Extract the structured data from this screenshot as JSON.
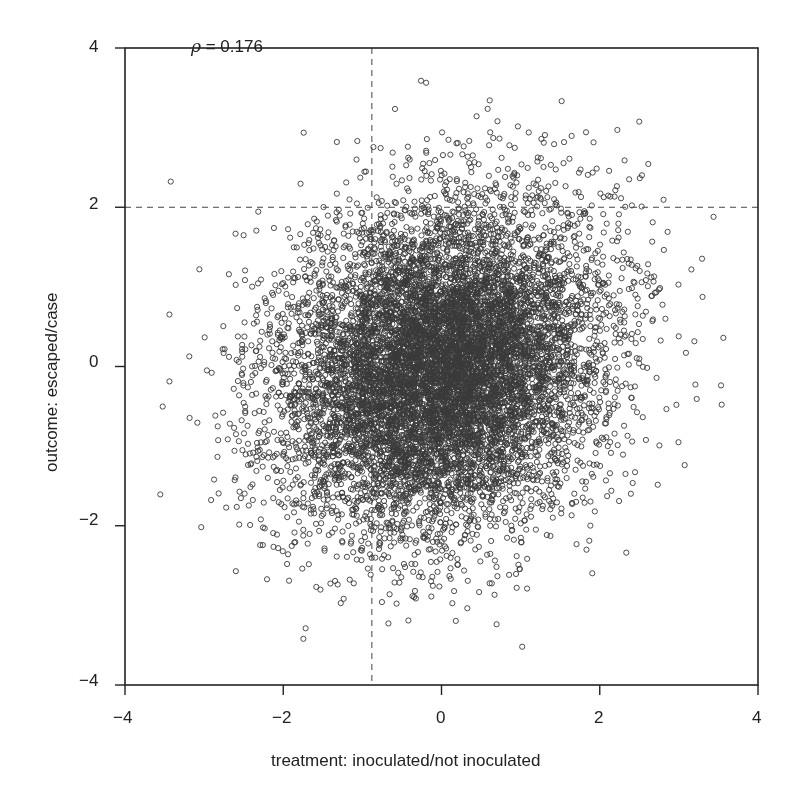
{
  "chart_data": {
    "type": "scatter",
    "title": "",
    "xlabel": "treatment: inoculated/not inoculated",
    "ylabel": "outcome: escaped/case",
    "xlim": [
      -4,
      4
    ],
    "ylim": [
      -4,
      4
    ],
    "xticks": [
      -4,
      -2,
      0,
      2,
      4
    ],
    "yticks": [
      -4,
      -2,
      0,
      2,
      4
    ],
    "xtick_labels": [
      "−4",
      "−2",
      "0",
      "2",
      "4"
    ],
    "ytick_labels": [
      "−4",
      "−2",
      "0",
      "2",
      "4"
    ],
    "grid": false,
    "legend": null,
    "annotation": {
      "symbol": "ρ",
      "text": " = 0.176",
      "x": -3.0,
      "y": 3.6
    },
    "correlation": 0.176,
    "distribution": {
      "kind": "bivariate_normal",
      "mean": [
        0,
        0
      ],
      "sd": [
        1,
        1
      ],
      "rho": 0.176,
      "n_points": 10000,
      "seed": 17
    },
    "reference_lines": [
      {
        "orientation": "vertical",
        "x": -0.88,
        "style": "dashed",
        "extent": [
          -4,
          4
        ]
      },
      {
        "orientation": "horizontal",
        "y": 2.0,
        "style": "dashed",
        "extent": [
          -4,
          4
        ]
      }
    ],
    "marker": {
      "shape": "open-circle",
      "radius": 2.6,
      "stroke": "#3a3a3a",
      "stroke_width": 0.9
    }
  },
  "colors": {
    "axis": "#222222",
    "dashed": "#444444",
    "point": "#3a3a3a"
  }
}
